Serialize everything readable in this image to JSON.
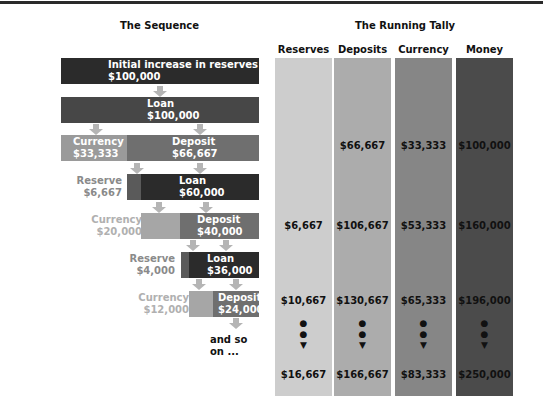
{
  "titles": {
    "sequence": "The Sequence",
    "tally": "The Running Tally"
  },
  "sequence": {
    "initial": {
      "label": "Initial increase in reserves",
      "value": "$100,000"
    },
    "loan1": {
      "label": "Loan",
      "value": "$100,000"
    },
    "currency1": {
      "label": "Currency",
      "value": "$33,333"
    },
    "deposit1": {
      "label": "Deposit",
      "value": "$66,667"
    },
    "reserve2": {
      "label": "Reserve",
      "value": "$6,667"
    },
    "loan2": {
      "label": "Loan",
      "value": "$60,000"
    },
    "currency2": {
      "label": "Currency",
      "value": "$20,000"
    },
    "deposit2": {
      "label": "Deposit",
      "value": "$40,000"
    },
    "reserve3": {
      "label": "Reserve",
      "value": "$4,000"
    },
    "loan3": {
      "label": "Loan",
      "value": "$36,000"
    },
    "currency3": {
      "label": "Currency",
      "value": "$12,000"
    },
    "deposit3": {
      "label": "Deposit",
      "value": "$24,000"
    },
    "andso": {
      "line1": "and so",
      "line2": "on ..."
    }
  },
  "tally": {
    "columns": [
      {
        "header": "Reserves",
        "color": "#c9c9c9",
        "values": [
          "",
          "$6,667",
          "$10,667",
          "$16,667"
        ]
      },
      {
        "header": "Deposits",
        "color": "#aaaaaa",
        "values": [
          "$66,667",
          "$106,667",
          "$130,667",
          "$166,667"
        ]
      },
      {
        "header": "Currency",
        "color": "#858585",
        "values": [
          "$33,333",
          "$53,333",
          "$65,333",
          "$83,333"
        ]
      },
      {
        "header": "Money",
        "color": "#4a4a4a",
        "values": [
          "$100,000",
          "$160,000",
          "$196,000",
          "$250,000"
        ]
      }
    ],
    "continuation": "• • ▼"
  },
  "colors": {
    "dark": "#2b2b2b",
    "loan": "#474747",
    "currency": "#9a9a9a",
    "deposit": "#6f6f6f",
    "arrow": "#b5b5b5",
    "reserveText": "#8a8a8a",
    "currencyText": "#b0b0b0"
  }
}
